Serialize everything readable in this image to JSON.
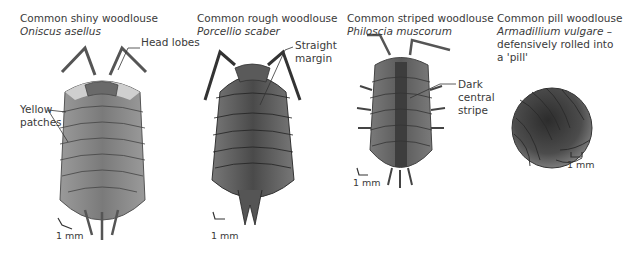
{
  "species": [
    {
      "common_name": "Common shiny woodlouse",
      "scientific_name": "Oniscus asellus",
      "labels": [
        "Head lobes",
        "Yellow",
        "patches"
      ],
      "scale": "1 mm"
    },
    {
      "common_name": "Common rough woodlouse",
      "scientific_name": "Porcellio scaber",
      "labels": [
        "Straight",
        "margin"
      ],
      "scale": "1 mm"
    },
    {
      "common_name": "Common striped woodlouse",
      "scientific_name": "Philoscia muscorum",
      "labels": [
        "Dark",
        "central",
        "stripe"
      ],
      "scale": "1 mm"
    },
    {
      "common_name": "Common pill woodlouse",
      "scientific_name": "Armadillium vulgare –",
      "extra_lines": [
        "defensively rolled into",
        "a 'pill'"
      ],
      "scale": "1 mm"
    }
  ],
  "colors": {
    "shiny_body": "#8a8a8a",
    "shiny_edge": "#c9c9c9",
    "rough_body": "#555555",
    "striped_body": "#6e6e6e",
    "stripe": "#3d3d3d",
    "pill_body": "#4a4a4a"
  }
}
